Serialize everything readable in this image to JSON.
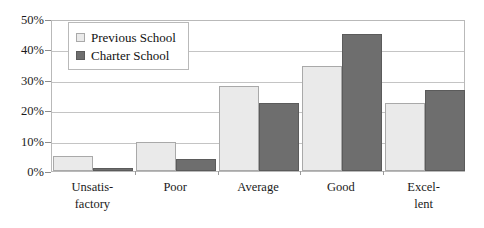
{
  "chart_data": {
    "type": "bar",
    "title": "",
    "subtitle": "",
    "xlabel": "",
    "ylabel": "",
    "categories": [
      "Unsatis-\nfactory",
      "Poor",
      "Average",
      "Good",
      "Excel-\nlent"
    ],
    "category_lines": [
      [
        "Unsatis-",
        "factory"
      ],
      [
        "Poor"
      ],
      [
        "Average"
      ],
      [
        "Good"
      ],
      [
        "Excel-",
        "lent"
      ]
    ],
    "series": [
      {
        "name": "Previous School",
        "color": "#eaeaea",
        "values": [
          5,
          9.5,
          28,
          34.5,
          22.5
        ]
      },
      {
        "name": "Charter School",
        "color": "#6e6e6e",
        "values": [
          1,
          4,
          22.5,
          45,
          26.5
        ]
      }
    ],
    "ylim": [
      0,
      50
    ],
    "ytick_values": [
      0,
      10,
      20,
      30,
      40,
      50
    ],
    "ytick_labels": [
      "0%",
      "10%",
      "20%",
      "30%",
      "40%",
      "50%"
    ],
    "value_suffix": "%",
    "grid": true,
    "grid_axis": "y",
    "legend_position": "upper-left-inside",
    "frame": true
  },
  "colors": {
    "previous_school": "#eaeaea",
    "charter_school": "#6e6e6e",
    "gridline": "#c4c4c4",
    "frame": "#b9b9b9",
    "text": "#1a1a1a",
    "background": "#ffffff"
  },
  "legend": {
    "entries": [
      {
        "label": "Previous School",
        "swatch": "light-square-swatch"
      },
      {
        "label": "Charter School",
        "swatch": "dark-square-swatch"
      }
    ]
  }
}
